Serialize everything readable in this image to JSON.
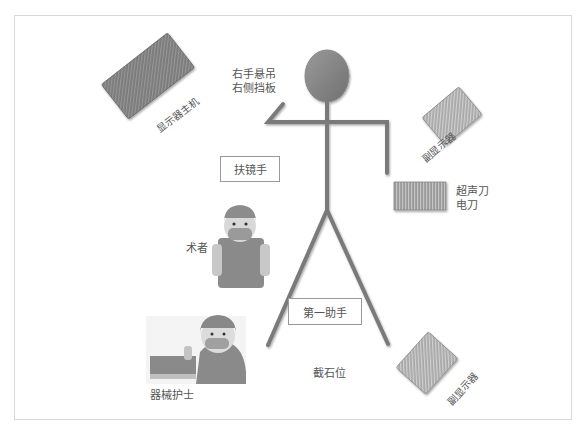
{
  "diagram": {
    "title": "截石位",
    "colors": {
      "figure": "#7a7a7a",
      "device_dark": "#6e6e6e",
      "device_light": "#b0b0b0",
      "frame": "#d8d8d8"
    },
    "devices": {
      "main_display": {
        "label": "显示器主机"
      },
      "sub_display_top": {
        "label": "副显示器"
      },
      "sub_display_bottom": {
        "label": "副显示器"
      },
      "ultrasonic_knife": {
        "lines": [
          "超声刀",
          "电刀"
        ]
      }
    },
    "arm_rest": {
      "lines": [
        "右手悬吊",
        "右侧挡板"
      ]
    },
    "roles": {
      "scope_holder": {
        "label": "扶镜手"
      },
      "surgeon": {
        "label": "术者"
      },
      "first_assistant": {
        "label": "第一助手"
      },
      "scrub_nurse": {
        "label": "器械护士"
      }
    },
    "position_label": "截石位"
  }
}
